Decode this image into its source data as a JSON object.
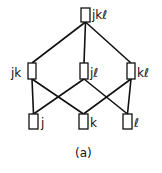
{
  "diagram": {
    "type": "lattice",
    "caption": "(a)",
    "nodes": [
      {
        "id": "jkl",
        "label": "jkℓ",
        "box": [
          81,
          8,
          9,
          14
        ],
        "label_pos": [
          92,
          9
        ],
        "label_side": "right"
      },
      {
        "id": "jk",
        "label": "jk",
        "box": [
          28,
          63,
          8,
          16
        ],
        "label_pos": [
          11,
          67
        ],
        "label_side": "left"
      },
      {
        "id": "jl",
        "label": "jℓ",
        "box": [
          80,
          63,
          8,
          16
        ],
        "label_pos": [
          90,
          67
        ],
        "label_side": "right"
      },
      {
        "id": "kl",
        "label": "kℓ",
        "box": [
          127,
          63,
          8,
          16
        ],
        "label_pos": [
          137,
          67
        ],
        "label_side": "right"
      },
      {
        "id": "j",
        "label": "j",
        "box": [
          29,
          114,
          9,
          15
        ],
        "label_pos": [
          41,
          117
        ],
        "label_side": "right"
      },
      {
        "id": "k",
        "label": "k",
        "box": [
          79,
          114,
          9,
          15
        ],
        "label_pos": [
          90,
          117
        ],
        "label_side": "right"
      },
      {
        "id": "l",
        "label": "ℓ",
        "box": [
          123,
          114,
          9,
          15
        ],
        "label_pos": [
          134,
          117
        ],
        "label_side": "right"
      }
    ],
    "edges": [
      {
        "from": "jkl",
        "to": "jk"
      },
      {
        "from": "jkl",
        "to": "jl"
      },
      {
        "from": "jkl",
        "to": "kl"
      },
      {
        "from": "jk",
        "to": "j"
      },
      {
        "from": "jk",
        "to": "k"
      },
      {
        "from": "jl",
        "to": "j"
      },
      {
        "from": "jl",
        "to": "l"
      },
      {
        "from": "kl",
        "to": "k"
      },
      {
        "from": "kl",
        "to": "l"
      }
    ],
    "colors": {
      "stroke": "#111111",
      "background": "#ffffff"
    }
  }
}
